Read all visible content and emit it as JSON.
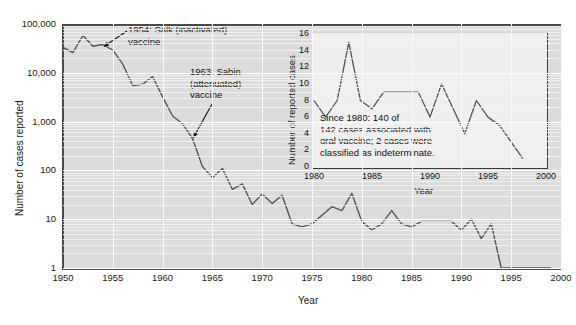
{
  "chart_data": [
    {
      "id": "main",
      "type": "line",
      "title": "",
      "xlabel": "Year",
      "ylabel": "Number of cases reported",
      "yscale": "log",
      "xlim": [
        1950,
        2000
      ],
      "ylim": [
        1,
        100000
      ],
      "xticks": [
        1950,
        1955,
        1960,
        1965,
        1970,
        1975,
        1980,
        1985,
        1990,
        1995,
        2000
      ],
      "xtick_labels": [
        "1950",
        "1955",
        "1960",
        "1965",
        "1970",
        "1975",
        "1980",
        "1985",
        "1990",
        "1995",
        "2000"
      ],
      "yticks": [
        1,
        10,
        100,
        1000,
        10000,
        100000
      ],
      "ytick_labels": [
        "1",
        "10",
        "100",
        "1,000",
        "10,000",
        "100,000"
      ],
      "grid": true,
      "legend": "none",
      "x": [
        1950,
        1951,
        1952,
        1953,
        1954,
        1955,
        1956,
        1957,
        1958,
        1959,
        1960,
        1961,
        1962,
        1963,
        1964,
        1965,
        1966,
        1967,
        1968,
        1969,
        1970,
        1971,
        1972,
        1973,
        1974,
        1975,
        1976,
        1977,
        1978,
        1979,
        1980,
        1981,
        1982,
        1983,
        1984,
        1985,
        1986,
        1987,
        1988,
        1989,
        1990,
        1991,
        1992,
        1993,
        1994,
        1995,
        1996,
        1997,
        1998,
        1999
      ],
      "values": [
        33000,
        26000,
        58000,
        35000,
        38000,
        29000,
        15000,
        5500,
        5800,
        8400,
        3200,
        1300,
        900,
        450,
        120,
        72,
        110,
        41,
        53,
        20,
        33,
        21,
        31,
        8,
        7,
        8,
        12,
        18,
        15,
        34,
        9,
        6,
        8,
        15,
        8,
        7,
        9,
        9,
        9,
        9,
        6,
        10,
        4,
        8,
        1,
        1,
        1,
        1,
        1,
        1
      ],
      "annotations": [
        {
          "text": "1954: Salk (inactivated)\nvaccine",
          "points_to_year": 1954,
          "points_to_value": 38000
        },
        {
          "text": "1963: Sabin\n(attenuated)\nvaccine",
          "points_to_year": 1963,
          "points_to_value": 450
        }
      ]
    },
    {
      "id": "inset",
      "type": "line",
      "title": "",
      "xlabel": "Year",
      "ylabel": "Number of reported cases",
      "yscale": "linear",
      "xlim": [
        1980,
        2000
      ],
      "ylim": [
        0,
        16
      ],
      "xticks": [
        1980,
        1985,
        1990,
        1995,
        2000
      ],
      "xtick_labels": [
        "1980",
        "1985",
        "1990",
        "1995",
        "2000"
      ],
      "yticks": [
        0,
        2,
        4,
        6,
        8,
        10,
        12,
        14,
        16
      ],
      "ytick_labels": [
        "0",
        "2",
        "4",
        "6",
        "8",
        "10",
        "12",
        "14",
        "16"
      ],
      "grid": false,
      "legend": "none",
      "x": [
        1980,
        1981,
        1982,
        1983,
        1984,
        1985,
        1986,
        1987,
        1988,
        1989,
        1990,
        1991,
        1992,
        1993,
        1994,
        1995,
        1996,
        1997,
        1998
      ],
      "values": [
        8,
        6,
        8,
        15,
        8,
        7,
        9,
        9,
        9,
        9,
        6,
        10,
        7,
        4,
        8,
        6,
        5,
        3,
        1
      ],
      "note": "Since 1980: 140 of\n142 cases associated with\noral vaccine; 2 cases were\nclassified as indeterminate."
    }
  ],
  "main": {
    "ylabel": "Number of cases reported",
    "xlabel": "Year",
    "annotation_salk": "1954: Salk (inactivated)\nvaccine",
    "annotation_sabin": "1963: Sabin\n(attenuated)\nvaccine"
  },
  "inset": {
    "ylabel": "Number of reported cases",
    "xlabel": "Year",
    "note": "Since 1980: 140 of\n142 cases associated with\noral vaccine; 2 cases were\nclassified as indeterminate."
  },
  "colors": {
    "line": "#555555",
    "plot_background": "#dcdcdc",
    "inset_background": "#efefef",
    "axis": "#4a4a4a",
    "text": "#1a1a1a"
  }
}
